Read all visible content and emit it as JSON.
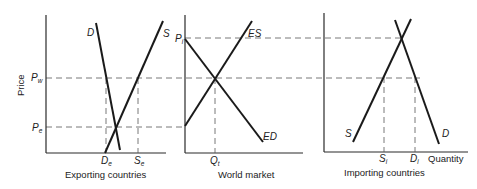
{
  "diagram": {
    "y_axis_label": "Price",
    "x_axis_label": "Quantity",
    "panels": [
      {
        "id": "exporting",
        "caption": "Exporting countries",
        "curves": {
          "demand": "D",
          "supply": "S"
        },
        "price_labels": {
          "world": {
            "main": "P",
            "sub": "w"
          },
          "equilibrium": {
            "main": "P",
            "sub": "e"
          }
        },
        "quantity_labels": {
          "demand": {
            "main": "D",
            "sub": "e"
          },
          "supply": {
            "main": "S",
            "sub": "e"
          }
        }
      },
      {
        "id": "world",
        "caption": "World market",
        "curves": {
          "excess_supply": "ES",
          "excess_demand": "ED"
        },
        "price_labels": {
          "importer": {
            "main": "P",
            "sub": "i"
          }
        },
        "quantity_labels": {
          "traded": {
            "main": "Q",
            "sub": "t"
          }
        }
      },
      {
        "id": "importing",
        "caption": "Importing countries",
        "curves": {
          "supply": "S",
          "demand": "D"
        },
        "quantity_labels": {
          "supply": {
            "main": "S",
            "sub": "i"
          },
          "demand": {
            "main": "D",
            "sub": "i"
          }
        }
      }
    ]
  }
}
